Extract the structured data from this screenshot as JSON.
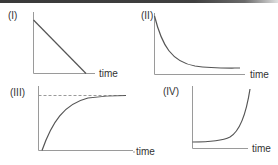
{
  "figure": {
    "colors": {
      "axis": "#9a9a9a",
      "curve": "#555555",
      "text": "#333333",
      "top_bar": "#3a3a3a"
    },
    "panels": [
      {
        "id": "I",
        "label": "(I)",
        "x_label": "time",
        "shape": "linear decrease to zero"
      },
      {
        "id": "II",
        "label": "(II)",
        "x_label": "time",
        "shape": "exponential decay toward a nonzero baseline"
      },
      {
        "id": "III",
        "label": "(III)",
        "x_label": "time",
        "shape": "rise from zero approaching a dashed asymptote"
      },
      {
        "id": "IV",
        "label": "(IV)",
        "x_label": "time",
        "shape": "flat then exponential growth"
      }
    ]
  }
}
